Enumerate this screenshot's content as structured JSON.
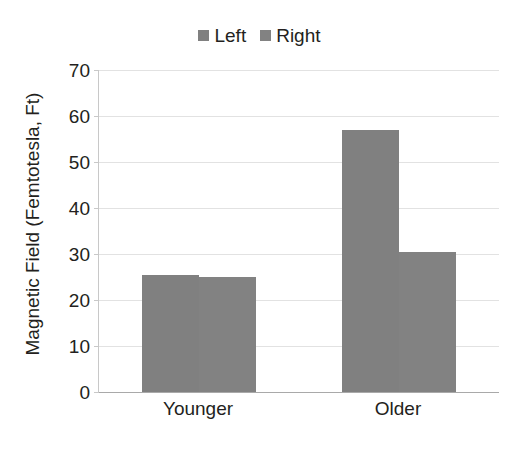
{
  "chart_data": {
    "type": "bar",
    "title": "",
    "xlabel": "",
    "ylabel": "Magnetic Field (Femtotesla, Ft)",
    "categories": [
      "Younger",
      "Older"
    ],
    "series": [
      {
        "name": "Left",
        "color": "#808080",
        "values": [
          25.5,
          57.0
        ]
      },
      {
        "name": "Right",
        "color": "#828282",
        "values": [
          25.0,
          30.5
        ]
      }
    ],
    "ylim": [
      0,
      70
    ],
    "ytick_values": [
      70,
      60,
      50,
      40,
      30,
      20,
      10,
      0
    ],
    "ytick_labels": [
      "70",
      "60",
      "50",
      "40",
      "30",
      "20",
      "10",
      "0"
    ],
    "grid": true,
    "legend_position": "top-center",
    "annotations": []
  },
  "legend": {
    "entries": [
      {
        "label": "Left"
      },
      {
        "label": "Right"
      }
    ]
  },
  "axes": {
    "y_title": "Magnetic Field (Femtotesla, Ft)"
  },
  "colors": {
    "bar_left": "#808080",
    "bar_right": "#828282",
    "gridline": "#e2e2e2",
    "axis": "#a9a9a9",
    "text": "#231f20",
    "background": "#ffffff"
  }
}
